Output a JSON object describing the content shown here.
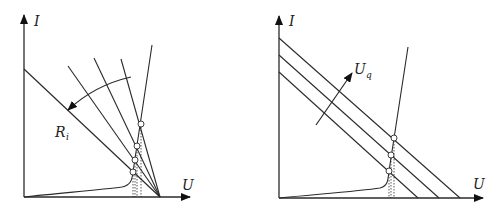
{
  "left_plot": {
    "y_axis_label": "I",
    "x_axis_label": "U",
    "arrow_label": "R",
    "arrow_label_sub": "i",
    "description": "Load lines rotating about a fixed open-circuit voltage point as internal resistance R_i changes; intersections with diode characteristic marked",
    "operating_points": 4
  },
  "right_plot": {
    "y_axis_label": "I",
    "x_axis_label": "U",
    "arrow_label": "U",
    "arrow_label_sub": "q",
    "description": "Parallel load lines shifting as source voltage U_q changes; intersections with diode characteristic marked",
    "operating_points": 3
  },
  "colors": {
    "line": "#2a2a2a",
    "background": "#ffffff"
  }
}
